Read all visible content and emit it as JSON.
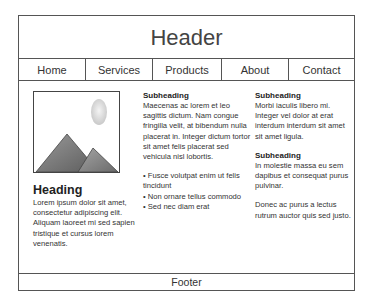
{
  "header": {
    "title": "Header"
  },
  "nav": {
    "items": [
      {
        "label": "Home"
      },
      {
        "label": "Services"
      },
      {
        "label": "Products"
      },
      {
        "label": "About"
      },
      {
        "label": "Contact"
      }
    ]
  },
  "content": {
    "image": {
      "icon": "image-placeholder-icon"
    },
    "col1": {
      "heading": "Heading",
      "body": "Lorem ipsum dolor sit amet, consectetur adipiscing elit. Aliquam laoreet mi sed sapien tristique et cursus lorem venenatis."
    },
    "col2": {
      "subheading": "Subheading",
      "body": "Maecenas ac lorem et leo sagittis dictum. Nam congue fringilla velit, at bibendum nulla placerat in. Integer dictum tortor sit amet felis placerat sed vehicula nisl lobortis.",
      "bullets": [
        "• Fusce volutpat enim ut felis tincidunt",
        "• Non ornare tellus commodo",
        "• Sed nec diam erat"
      ]
    },
    "col3": {
      "sections": [
        {
          "subheading": "Subheading",
          "body": "Morbi iaculis libero mi. Integer vel dolor at erat interdum interdum sit amet sit amet ligula."
        },
        {
          "subheading": "Subheading",
          "body": "In molestie massa eu sem dapibus et consequat purus pulvinar."
        }
      ],
      "closing": "Donec ac purus a lectus rutrum auctor quis sed justo."
    }
  },
  "footer": {
    "label": "Footer"
  }
}
